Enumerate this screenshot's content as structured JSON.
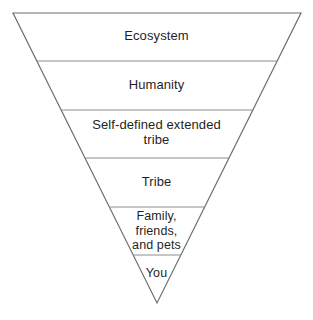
{
  "diagram": {
    "type": "inverted-pyramid",
    "orientation": "point-down",
    "background_color": "#ffffff",
    "outline_color": "#6e6e6e",
    "divider_color": "#8c8c8c",
    "text_color": "#1f1f1f",
    "bands": [
      {
        "id": "ecosystem",
        "order": 1,
        "label": "Ecosystem",
        "label_lines": [
          "Ecosystem"
        ],
        "scope": "widest"
      },
      {
        "id": "humanity",
        "order": 2,
        "label": "Humanity",
        "label_lines": [
          "Humanity"
        ],
        "scope": "wide"
      },
      {
        "id": "self-defined-extended-tribe",
        "order": 3,
        "label": "Self-defined extended tribe",
        "label_lines": [
          "Self-defined extended",
          "tribe"
        ],
        "scope": "medium"
      },
      {
        "id": "tribe",
        "order": 4,
        "label": "Tribe",
        "label_lines": [
          "Tribe"
        ],
        "scope": "narrow"
      },
      {
        "id": "family-friends-and-pets",
        "order": 5,
        "label": "Family, friends, and pets",
        "label_lines": [
          "Family,",
          "friends,",
          "and pets"
        ],
        "scope": "narrower"
      },
      {
        "id": "you",
        "order": 6,
        "label": "You",
        "label_lines": [
          "You"
        ],
        "scope": "apex"
      }
    ],
    "labels_text": {
      "ecosystem": "Ecosystem",
      "humanity": "Humanity",
      "self_tribe": "Self-defined extended\ntribe",
      "tribe": "Tribe",
      "family": "Family,\nfriends,\nand pets",
      "you": "You"
    }
  }
}
